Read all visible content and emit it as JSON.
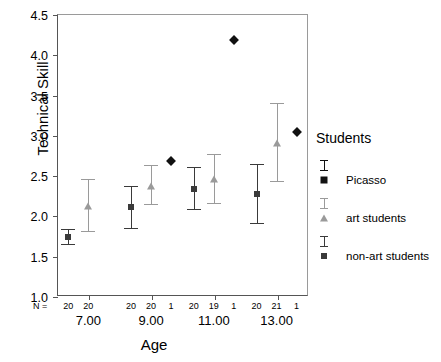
{
  "chart_data": {
    "type": "scatter",
    "title": "",
    "xlabel": "Age",
    "ylabel": "Technical Skill",
    "ylim": [
      1.0,
      4.5
    ],
    "yticks": [
      "1.0",
      "1.5",
      "2.0",
      "2.5",
      "3.0",
      "3.5",
      "4.0",
      "4.5"
    ],
    "ytick_values": [
      1.0,
      1.5,
      2.0,
      2.5,
      3.0,
      3.5,
      4.0,
      4.5
    ],
    "grid": false,
    "categories": [
      "7.00",
      "9.00",
      "11.00",
      "13.00"
    ],
    "n_row_label": "N =",
    "legend": {
      "title": "Students",
      "position": "right",
      "entries": [
        {
          "label": "Picasso",
          "marker": "diamond",
          "color": "#111111"
        },
        {
          "label": "art students",
          "marker": "triangle",
          "color": "#9a9a9a"
        },
        {
          "label": "non-art students",
          "marker": "square",
          "color": "#3a3a3a"
        }
      ]
    },
    "series": [
      {
        "name": "non-art students",
        "marker": "square",
        "color": "#3a3a3a",
        "points": [
          {
            "category": "7.00",
            "n": "20",
            "mean": 1.73,
            "low": 1.63,
            "high": 1.83
          },
          {
            "category": "9.00",
            "n": "20",
            "mean": 2.1,
            "low": 1.83,
            "high": 2.37
          },
          {
            "category": "11.00",
            "n": "20",
            "mean": 2.33,
            "low": 2.07,
            "high": 2.6
          },
          {
            "category": "13.00",
            "n": "20",
            "mean": 2.27,
            "low": 1.89,
            "high": 2.64
          }
        ]
      },
      {
        "name": "art students",
        "marker": "triangle",
        "color": "#9a9a9a",
        "points": [
          {
            "category": "7.00",
            "n": "20",
            "mean": 2.12,
            "low": 1.8,
            "high": 2.45
          },
          {
            "category": "9.00",
            "n": "20",
            "mean": 2.37,
            "low": 2.13,
            "high": 2.62
          },
          {
            "category": "11.00",
            "n": "19",
            "mean": 2.45,
            "low": 2.14,
            "high": 2.76
          },
          {
            "category": "13.00",
            "n": "21",
            "mean": 2.9,
            "low": 2.42,
            "high": 3.39
          }
        ]
      },
      {
        "name": "Picasso",
        "marker": "diamond",
        "color": "#111111",
        "points": [
          {
            "category": "9.00",
            "n": "1",
            "mean": 2.68
          },
          {
            "category": "11.00",
            "n": "1",
            "mean": 4.18
          },
          {
            "category": "13.00",
            "n": "1",
            "mean": 3.03
          }
        ]
      }
    ]
  }
}
